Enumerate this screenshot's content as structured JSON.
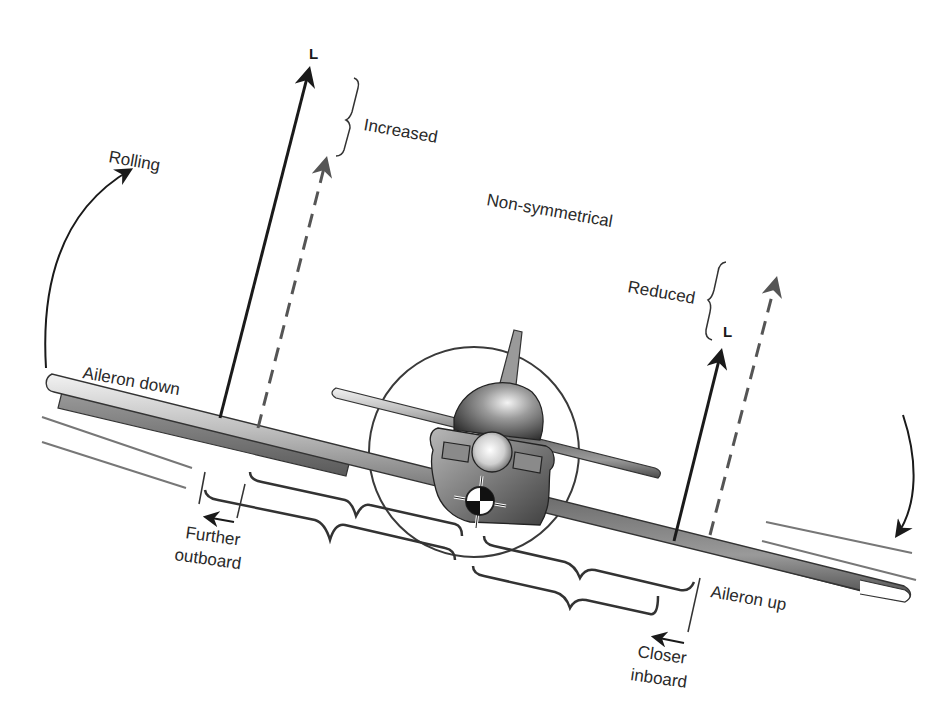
{
  "diagram": {
    "type": "aileron-roll-front-view",
    "labels": {
      "rolling": "Rolling",
      "increased": "Increased",
      "non_symmetrical": "Non-symmetrical",
      "reduced": "Reduced",
      "lift_left": "L",
      "lift_right": "L",
      "aileron_down": "Aileron down",
      "aileron_up": "Aileron up",
      "further_outboard_line1": "Further",
      "further_outboard_line2": "outboard",
      "closer_inboard_line1": "Closer",
      "closer_inboard_line2": "inboard"
    },
    "colors": {
      "ink": "#1a1a1a",
      "dashed_arrow": "#555555",
      "outline": "#333333",
      "motion_lines": "#777777",
      "background": "#ffffff"
    }
  }
}
